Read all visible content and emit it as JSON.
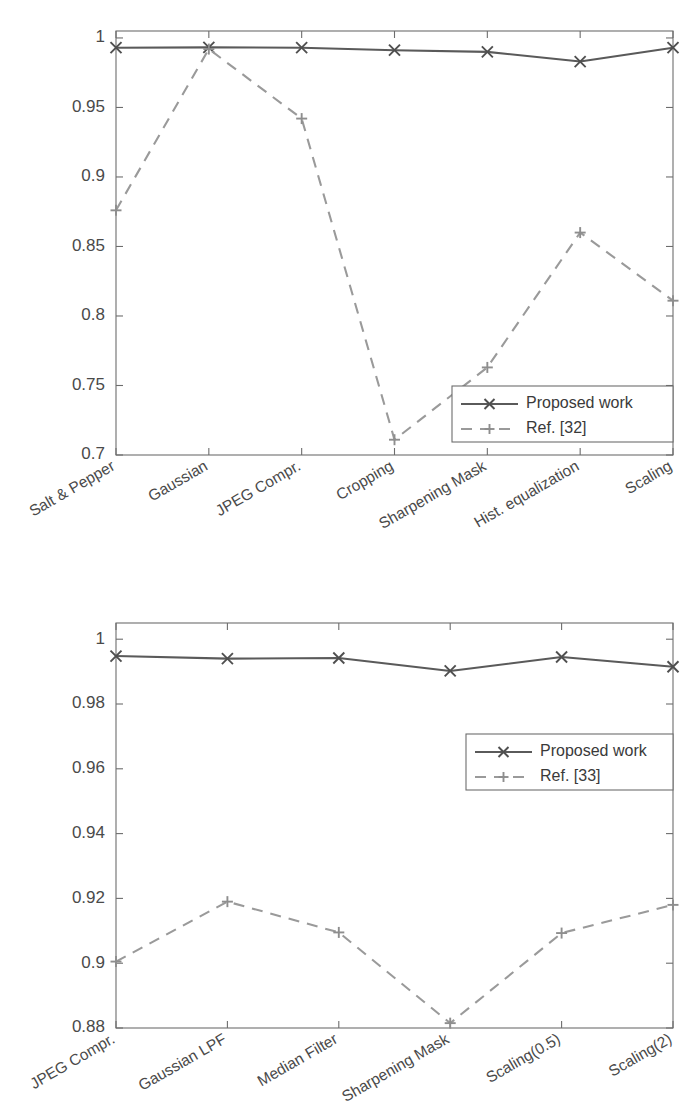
{
  "document": {
    "kind": "two-panel-line-chart-figure",
    "background_color": "#ffffff"
  },
  "style": {
    "solid_line_color": "#5a5a5a",
    "dashed_line_color": "#9a9a9a",
    "axis_color": "#6d6d6d",
    "text_color": "#3a3a3a"
  },
  "chart_data": [
    {
      "id": "top",
      "type": "line",
      "title": "",
      "xlabel": "",
      "ylabel": "",
      "ylim": [
        0.7,
        1.005
      ],
      "yticks": [
        0.7,
        0.75,
        0.8,
        0.85,
        0.9,
        0.95,
        1
      ],
      "ytick_labels": [
        "0.7",
        "0.75",
        "0.8",
        "0.85",
        "0.9",
        "0.95",
        "1"
      ],
      "grid": false,
      "legend_position": "lower-right",
      "xtick_rotation_deg": 30,
      "categories": [
        "Salt & Pepper",
        "Gaussian",
        "JPEG Compr.",
        "Cropping",
        "Sharpening Mask",
        "Hist. equalization",
        "Scaling"
      ],
      "series": [
        {
          "name": "Proposed work",
          "linestyle": "solid",
          "marker": "x",
          "color": "#5a5a5a",
          "values": [
            0.993,
            0.9932,
            0.993,
            0.9912,
            0.99,
            0.983,
            0.993
          ]
        },
        {
          "name": "Ref. [32]",
          "linestyle": "dashed",
          "marker": "+",
          "color": "#9a9a9a",
          "values": [
            0.876,
            0.992,
            0.942,
            0.711,
            0.763,
            0.86,
            0.811
          ]
        }
      ]
    },
    {
      "id": "bottom",
      "type": "line",
      "title": "",
      "xlabel": "",
      "ylabel": "",
      "ylim": [
        0.88,
        1.005
      ],
      "yticks": [
        0.88,
        0.9,
        0.92,
        0.94,
        0.96,
        0.98,
        1
      ],
      "ytick_labels": [
        "0.88",
        "0.9",
        "0.92",
        "0.94",
        "0.96",
        "0.98",
        "1"
      ],
      "grid": false,
      "legend_position": "middle-right",
      "xtick_rotation_deg": 30,
      "categories": [
        "JPEG Compr.",
        "Gaussian LPF",
        "Median Filter",
        "Sharpening Mask",
        "Scaling(0.5)",
        "Scaling(2)"
      ],
      "series": [
        {
          "name": "Proposed work",
          "linestyle": "solid",
          "marker": "x",
          "color": "#5a5a5a",
          "values": [
            0.9948,
            0.994,
            0.9942,
            0.9902,
            0.9945,
            0.9915
          ]
        },
        {
          "name": "Ref. [33]",
          "linestyle": "dashed",
          "marker": "+",
          "color": "#9a9a9a",
          "values": [
            0.9005,
            0.919,
            0.9095,
            0.8815,
            0.9093,
            0.918
          ]
        }
      ]
    }
  ]
}
